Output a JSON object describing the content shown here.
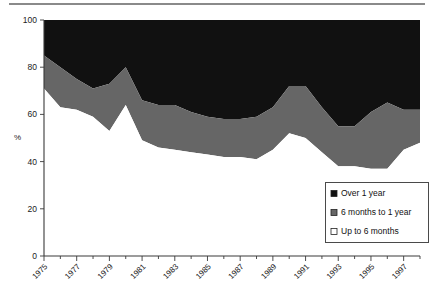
{
  "page": {
    "background_color": "#ffffff",
    "rule_color": "#8a8a8a"
  },
  "chart_data": {
    "type": "area",
    "stacked": true,
    "title": "",
    "subtitle": "",
    "xlabel": "",
    "ylabel": "%",
    "ylim": [
      0,
      100
    ],
    "xlim": [
      1975,
      1998
    ],
    "grid": false,
    "legend_position": "inside-bottom-right",
    "x": [
      1975,
      1976,
      1977,
      1978,
      1979,
      1980,
      1981,
      1982,
      1983,
      1984,
      1985,
      1986,
      1987,
      1988,
      1989,
      1990,
      1991,
      1992,
      1993,
      1994,
      1995,
      1996,
      1997,
      1998
    ],
    "tick_labels": [
      "1975",
      "1977",
      "1979",
      "1981",
      "1983",
      "1985",
      "1987",
      "1989",
      "1991",
      "1993",
      "1995",
      "1997"
    ],
    "ytick_labels": [
      "0",
      "20",
      "40",
      "60",
      "80",
      "100"
    ],
    "yticks": [
      0,
      20,
      40,
      60,
      80,
      100
    ],
    "series": [
      {
        "name": "Up to 6 months",
        "color": "#ffffff",
        "edge_color": "#000000",
        "values": [
          71,
          63,
          62,
          59,
          53,
          64,
          49,
          46,
          45,
          44,
          43,
          42,
          42,
          41,
          45,
          52,
          50,
          44,
          38,
          38,
          37,
          37,
          45,
          48
        ]
      },
      {
        "name": "6 months to 1 year",
        "color": "#666666",
        "edge_color": "#000000",
        "values": [
          14,
          17,
          13,
          12,
          20,
          16,
          17,
          18,
          19,
          17,
          16,
          16,
          16,
          18,
          18,
          20,
          22,
          19,
          17,
          17,
          24,
          28,
          17,
          14
        ]
      },
      {
        "name": "Over 1 year",
        "color": "#111111",
        "edge_color": "#000000",
        "values": [
          15,
          20,
          25,
          29,
          27,
          20,
          34,
          36,
          36,
          39,
          41,
          42,
          42,
          41,
          37,
          28,
          28,
          37,
          45,
          45,
          39,
          35,
          38,
          38
        ]
      }
    ],
    "cumulative_upper_band_1": [
      71,
      63,
      62,
      59,
      53,
      64,
      49,
      46,
      45,
      44,
      43,
      42,
      42,
      41,
      45,
      52,
      50,
      44,
      38,
      38,
      37,
      37,
      45,
      48
    ],
    "cumulative_upper_band_2": [
      85,
      80,
      75,
      71,
      73,
      80,
      66,
      64,
      64,
      61,
      59,
      58,
      58,
      59,
      63,
      72,
      72,
      63,
      55,
      55,
      61,
      65,
      62,
      62
    ]
  },
  "legend": {
    "items": [
      {
        "label": "Over 1 year",
        "swatch": "#111111"
      },
      {
        "label": "6 months to 1 year",
        "swatch": "#666666"
      },
      {
        "label": "Up to 6 months",
        "swatch": "#ffffff"
      }
    ]
  }
}
